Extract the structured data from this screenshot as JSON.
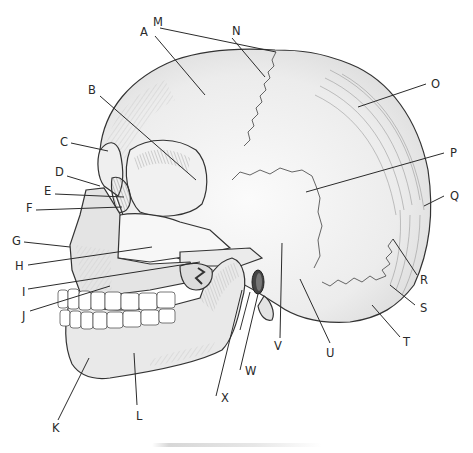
{
  "diagram": {
    "labels": [
      {
        "id": "A",
        "text": "A",
        "x": 140,
        "y": 36,
        "lx1": 155,
        "ly1": 36,
        "lx2": 205,
        "ly2": 95
      },
      {
        "id": "B",
        "text": "B",
        "x": 88,
        "y": 94,
        "lx1": 100,
        "ly1": 96,
        "lx2": 196,
        "ly2": 180
      },
      {
        "id": "C",
        "text": "C",
        "x": 60,
        "y": 146,
        "lx1": 71,
        "ly1": 143,
        "lx2": 108,
        "ly2": 151
      },
      {
        "id": "D",
        "text": "D",
        "x": 55,
        "y": 176,
        "lx1": 67,
        "ly1": 176,
        "lx2": 100,
        "ly2": 186
      },
      {
        "id": "E",
        "text": "E",
        "x": 44,
        "y": 195,
        "lx1": 55,
        "ly1": 194,
        "lx2": 124,
        "ly2": 197
      },
      {
        "id": "F",
        "text": "F",
        "x": 26,
        "y": 212,
        "lx1": 36,
        "ly1": 210,
        "lx2": 122,
        "ly2": 207
      },
      {
        "id": "G",
        "text": "G",
        "x": 12,
        "y": 245,
        "lx1": 24,
        "ly1": 242,
        "lx2": 70,
        "ly2": 247
      },
      {
        "id": "H",
        "text": "H",
        "x": 15,
        "y": 270,
        "lx1": 28,
        "ly1": 265,
        "lx2": 152,
        "ly2": 247
      },
      {
        "id": "I",
        "text": "I",
        "x": 22,
        "y": 296,
        "lx1": 28,
        "ly1": 289,
        "lx2": 200,
        "ly2": 262
      },
      {
        "id": "J",
        "text": "J",
        "x": 22,
        "y": 320,
        "lx1": 30,
        "ly1": 311,
        "lx2": 110,
        "ly2": 286
      },
      {
        "id": "K",
        "text": "K",
        "x": 52,
        "y": 432,
        "lx1": 58,
        "ly1": 420,
        "lx2": 89,
        "ly2": 358
      },
      {
        "id": "L",
        "text": "L",
        "x": 136,
        "y": 420,
        "lx1": 137,
        "ly1": 405,
        "lx2": 134,
        "ly2": 353
      },
      {
        "id": "M",
        "text": "M",
        "x": 153,
        "y": 26,
        "lx1": 160,
        "ly1": 28,
        "lx2": 276,
        "ly2": 52
      },
      {
        "id": "N",
        "text": "N",
        "x": 232,
        "y": 35,
        "lx1": 232,
        "ly1": 38,
        "lx2": 265,
        "ly2": 77
      },
      {
        "id": "O",
        "text": "O",
        "x": 431,
        "y": 88,
        "lx1": 426,
        "ly1": 84,
        "lx2": 358,
        "ly2": 107
      },
      {
        "id": "P",
        "text": "P",
        "x": 450,
        "y": 157,
        "lx1": 444,
        "ly1": 153,
        "lx2": 306,
        "ly2": 192
      },
      {
        "id": "Q",
        "text": "Q",
        "x": 450,
        "y": 200,
        "lx1": 444,
        "ly1": 196,
        "lx2": 424,
        "ly2": 206
      },
      {
        "id": "R",
        "text": "R",
        "x": 420,
        "y": 284,
        "lx1": 417,
        "ly1": 275,
        "lx2": 393,
        "ly2": 239
      },
      {
        "id": "S",
        "text": "S",
        "x": 420,
        "y": 312,
        "lx1": 415,
        "ly1": 305,
        "lx2": 390,
        "ly2": 285
      },
      {
        "id": "T",
        "text": "T",
        "x": 403,
        "y": 346,
        "lx1": 400,
        "ly1": 337,
        "lx2": 372,
        "ly2": 305
      },
      {
        "id": "U",
        "text": "U",
        "x": 326,
        "y": 357,
        "lx1": 330,
        "ly1": 343,
        "lx2": 300,
        "ly2": 279
      },
      {
        "id": "V",
        "text": "V",
        "x": 274,
        "y": 350,
        "lx1": 280,
        "ly1": 338,
        "lx2": 282,
        "ly2": 243
      },
      {
        "id": "W",
        "text": "W",
        "x": 245,
        "y": 375,
        "lx1": 240,
        "ly1": 370,
        "lx2": 258,
        "ly2": 294
      },
      {
        "id": "X",
        "text": "X",
        "x": 221,
        "y": 402,
        "lx1": 216,
        "ly1": 396,
        "lx2": 242,
        "ly2": 290
      }
    ],
    "colors": {
      "background": "#ffffff",
      "bone_light": "#f4f4f4",
      "bone_mid": "#e6e6e6",
      "bone_shade": "#d3d3d3",
      "ink": "#2b2b2b",
      "teeth": "#ffffff"
    }
  }
}
